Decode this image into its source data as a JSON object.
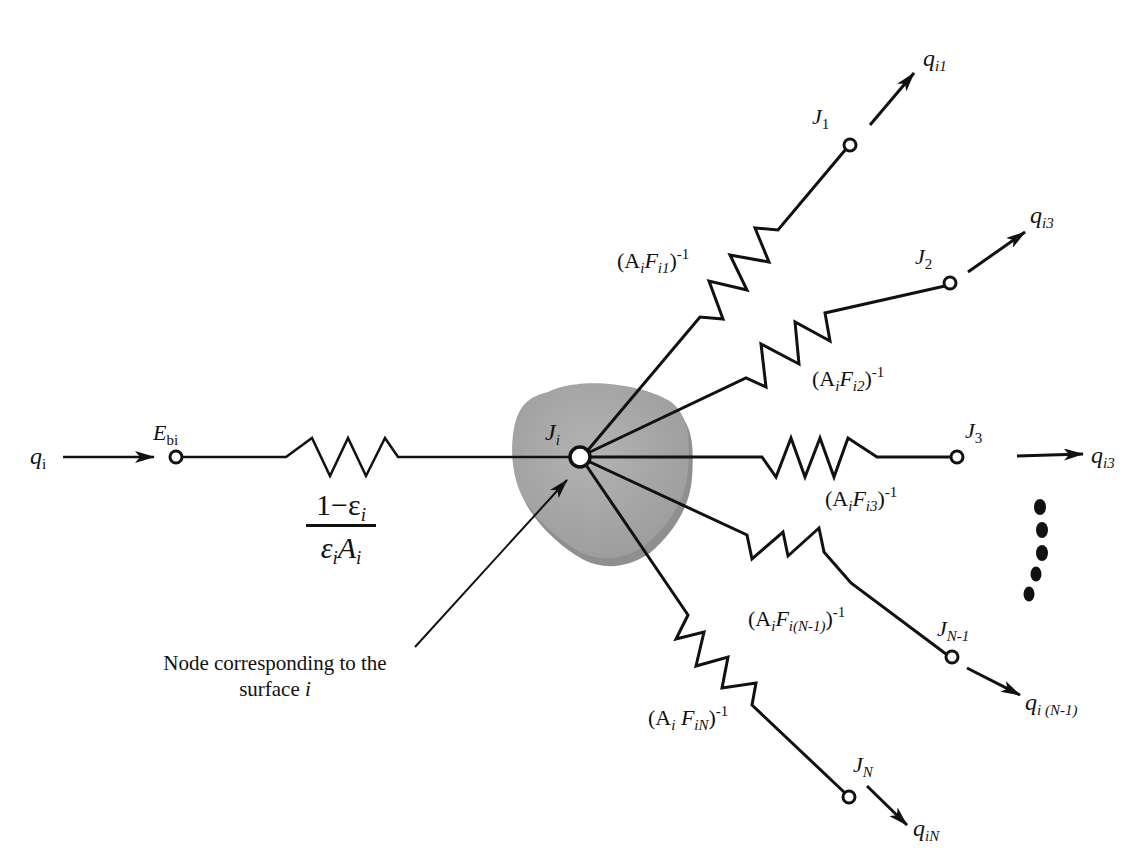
{
  "diagram": {
    "type": "radiation network (surface node connected to other surfaces)",
    "input": {
      "flux_label": "q",
      "flux_sub": "i",
      "node_label": "E",
      "node_sub": "bi"
    },
    "surface_resistance": {
      "numerator": "1−ε",
      "numerator_sub": "i",
      "denominator_eps": "ε",
      "denominator_eps_sub": "i",
      "denominator_area": "A",
      "denominator_area_sub": "i"
    },
    "center_node": {
      "label": "J",
      "sub": "i",
      "fill_color": "#a9a9a9"
    },
    "annotation": {
      "line1": "Node corresponding to the",
      "line2_prefix": "surface ",
      "line2_italic": "i"
    },
    "branches": [
      {
        "node": "J",
        "node_sub": "1",
        "res_prefix": "(A",
        "res_a_sub": "i",
        "res_f": "F",
        "res_f_sub": "i1",
        "res_suffix": ")",
        "res_exp": "-1",
        "flux": "q",
        "flux_sub": "i1"
      },
      {
        "node": "J",
        "node_sub": "2",
        "res_prefix": "(A",
        "res_a_sub": "i",
        "res_f": "F",
        "res_f_sub": "i2",
        "res_suffix": ")",
        "res_exp": "-1",
        "flux": "q",
        "flux_sub": "i3"
      },
      {
        "node": "J",
        "node_sub": "3",
        "res_prefix": "(A",
        "res_a_sub": "i",
        "res_f": "F",
        "res_f_sub": "i3",
        "res_suffix": ")",
        "res_exp": "-1",
        "flux": "q",
        "flux_sub": "i3"
      },
      {
        "node": "J",
        "node_sub": "N-1",
        "res_prefix": "(A",
        "res_a_sub": "i",
        "res_f": "F",
        "res_f_sub": "i(N-1)",
        "res_suffix": ")",
        "res_exp": "-1",
        "flux": "q",
        "flux_sub": "i (N-1)"
      },
      {
        "node": "J",
        "node_sub": "N",
        "res_prefix": "(A",
        "res_a_sub": "i",
        "res_f": " F",
        "res_f_sub": "iN",
        "res_suffix": ")",
        "res_exp": "-1",
        "flux": "q",
        "flux_sub": "iN"
      }
    ],
    "ellipsis_dots": 5
  }
}
